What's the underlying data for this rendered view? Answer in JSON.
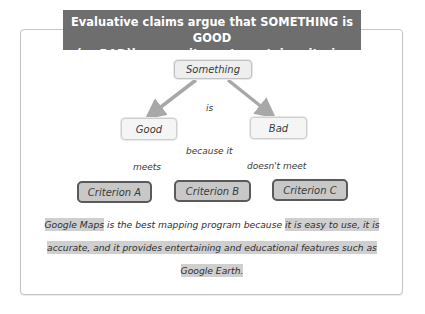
{
  "title": {
    "line1": "Evaluative claims argue that SOMETHING is GOOD",
    "line2": "(or BAD)because it meets certain criteria."
  },
  "diagram": {
    "root": "Something",
    "connector_is": "is",
    "good": "Good",
    "bad": "Bad",
    "connector_because": "because it",
    "meets": "meets",
    "doesnt_meet": "doesn't meet",
    "criteria": [
      "Criterion A",
      "Criterion B",
      "Criterion C"
    ]
  },
  "example": {
    "subject": "Google Maps",
    "claim": " is the best mapping program because ",
    "reason_part1": "it is easy to use, it is",
    "reason_part2": "accurate, and it provides entertaining and educational features such as",
    "reason_part3": "Google Earth."
  },
  "colors": {
    "banner": "#6e6e6e",
    "criterion_fill": "#c8c8c8",
    "criterion_border": "#5a5a5a",
    "highlight": "#cfcfcf",
    "arrow": "#a8a8a8"
  }
}
